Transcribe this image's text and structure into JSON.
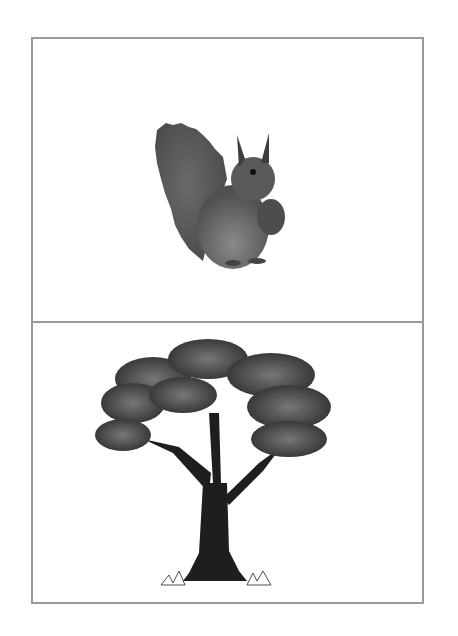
{
  "card": {
    "border_color": "#9a9a9a",
    "panels": [
      {
        "id": "top",
        "subject": "squirrel",
        "description": "Grayscale illustration of a squirrel sitting upright holding a pine cone"
      },
      {
        "id": "bottom",
        "subject": "tree",
        "description": "Grayscale illustration of a large leafy tree with dark trunk and grass at base"
      }
    ]
  }
}
